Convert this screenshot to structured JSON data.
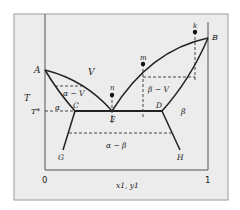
{
  "figure": {
    "background": "#ececec",
    "line_color": "#222222",
    "axis": {
      "xlabel": "x1, y1",
      "ylabel": "T",
      "x_min_label": "0",
      "x_max_label": "1",
      "t_star_label": "T*"
    },
    "points": {
      "A": "A",
      "B": "B",
      "C": "C",
      "D": "D",
      "E": "E",
      "G": "G",
      "H": "H",
      "m": "m",
      "n": "n",
      "k": "k"
    },
    "regions": {
      "vapor": "V",
      "alpha_vapor": "α − V",
      "beta_vapor": "β − V",
      "alpha": "α",
      "beta": "β",
      "alpha_beta": "α − β"
    }
  }
}
